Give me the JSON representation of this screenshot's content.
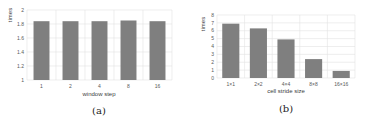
{
  "chart_data": [
    {
      "type": "bar",
      "caption": "(a)",
      "title": "",
      "xlabel": "window step",
      "ylabel": "times",
      "categories": [
        "1",
        "2",
        "4",
        "8",
        "16"
      ],
      "values": [
        1.84,
        1.84,
        1.84,
        1.85,
        1.84
      ],
      "ylim": [
        1,
        2
      ],
      "yticks": [
        "1",
        "1.2",
        "1.4",
        "1.6",
        "1.8",
        "2"
      ],
      "ytick_values": [
        1,
        1.2,
        1.4,
        1.6,
        1.8,
        2
      ],
      "grid": true,
      "bar_color": "#7f7f7f"
    },
    {
      "type": "bar",
      "caption": "(b)",
      "title": "",
      "xlabel": "cell stride size",
      "ylabel": "times",
      "categories": [
        "1×1",
        "2×2",
        "4×4",
        "8×8",
        "16×16"
      ],
      "values": [
        6.9,
        6.3,
        4.9,
        2.4,
        0.9
      ],
      "ylim": [
        0,
        8
      ],
      "yticks": [
        "0",
        "1",
        "2",
        "3",
        "4",
        "5",
        "6",
        "7",
        "8"
      ],
      "ytick_values": [
        0,
        1,
        2,
        3,
        4,
        5,
        6,
        7,
        8
      ],
      "grid": true,
      "bar_color": "#7f7f7f"
    }
  ]
}
